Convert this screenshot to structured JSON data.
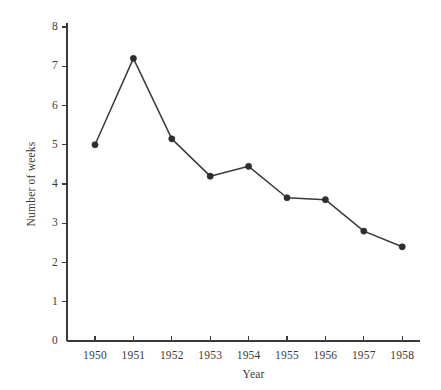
{
  "chart_data": {
    "type": "line",
    "title": "",
    "subtitle": "",
    "xlabel": "Year",
    "ylabel": "Number of weeks",
    "categories": [
      "1950",
      "1951",
      "1952",
      "1953",
      "1954",
      "1955",
      "1956",
      "1957",
      "1958"
    ],
    "values": [
      5.0,
      7.2,
      5.15,
      4.2,
      4.45,
      3.65,
      3.6,
      2.8,
      2.4
    ],
    "series": [
      {
        "name": "Number of weeks",
        "values": [
          5.0,
          7.2,
          5.15,
          4.2,
          4.45,
          3.65,
          3.6,
          2.8,
          2.4
        ]
      }
    ],
    "xlim": [
      1949.4,
      1958.6
    ],
    "ylim": [
      0,
      8.3
    ],
    "ytick_labels": [
      "0",
      "1",
      "2",
      "3",
      "4",
      "5",
      "6",
      "7",
      "8"
    ],
    "ytick_values": [
      0,
      1,
      2,
      3,
      4,
      5,
      6,
      7,
      8
    ],
    "xtick_labels": [
      "1950",
      "1951",
      "1952",
      "1953",
      "1954",
      "1955",
      "1956",
      "1957",
      "1958"
    ],
    "grid": false,
    "legend": false,
    "legend_position": "none",
    "marker": "filled-circle",
    "annotations": []
  },
  "style": {
    "ink": "#3a3a3a",
    "marker_color": "#2e2e2e",
    "background": "#ffffff"
  }
}
